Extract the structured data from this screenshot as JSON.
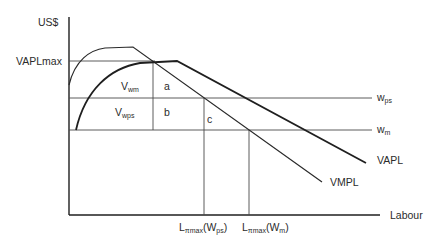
{
  "diagram": {
    "y_axis_label": "US$",
    "x_axis_label": "Labour",
    "y_ticks": {
      "vaplmax": "VAPLmax"
    },
    "wage_lines": {
      "wps": {
        "main": "w",
        "sub": "ps"
      },
      "wm": {
        "main": "w",
        "sub": "m"
      }
    },
    "curves": {
      "vapl": "VAPL",
      "vmpl": "VMPL"
    },
    "regions": {
      "vwm": {
        "main": "V",
        "sub": "wm"
      },
      "vwps": {
        "main": "V",
        "sub": "wps"
      },
      "a": "a",
      "b": "b",
      "c": "c"
    },
    "x_ticks": {
      "lpimax_wps": {
        "main": "L",
        "sub": "πmax",
        "paren_open": "(W",
        "paren_sub": "ps",
        "paren_close": ")"
      },
      "lpimax_wm": {
        "main": "L",
        "sub": "πmax",
        "paren_open": "(W",
        "paren_sub": "m",
        "paren_close": ")"
      }
    }
  }
}
